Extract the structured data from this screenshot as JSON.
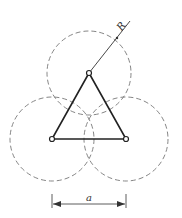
{
  "diagram": {
    "labels": {
      "radius": "R",
      "side": "a"
    },
    "circles": [
      {
        "name": "top",
        "cx": 89,
        "cy": 73,
        "r": 42
      },
      {
        "name": "left",
        "cx": 52,
        "cy": 139,
        "r": 42
      },
      {
        "name": "right",
        "cx": 126,
        "cy": 139,
        "r": 42
      }
    ],
    "triangle": {
      "vertices": [
        [
          89,
          73
        ],
        [
          52,
          139
        ],
        [
          126,
          139
        ]
      ]
    },
    "colors": {
      "stroke": "#333333",
      "dashed": "#777777"
    }
  }
}
